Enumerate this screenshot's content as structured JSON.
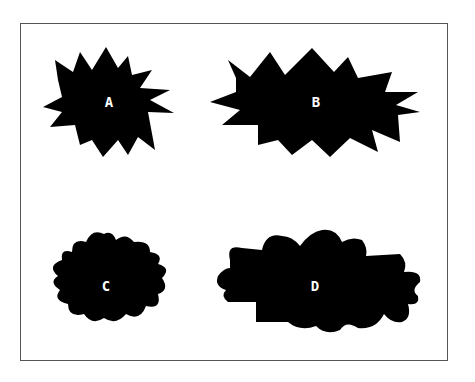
{
  "figure": {
    "shapes": [
      {
        "id": "A",
        "label": "A",
        "style": "spiky",
        "size": "small"
      },
      {
        "id": "B",
        "label": "B",
        "style": "spiky",
        "size": "large"
      },
      {
        "id": "C",
        "label": "C",
        "style": "rounded",
        "size": "small"
      },
      {
        "id": "D",
        "label": "D",
        "style": "rounded",
        "size": "large"
      }
    ],
    "colors": {
      "shape": "#000000",
      "label": "#ffffff",
      "frame": "#555555",
      "background": "#ffffff"
    }
  }
}
